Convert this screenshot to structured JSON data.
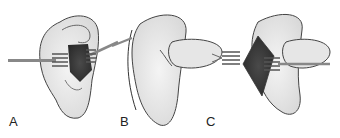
{
  "figure": {
    "panels": [
      {
        "label": "A",
        "description": "Ear with retractors exposing incision in concha"
      },
      {
        "label": "B",
        "description": "Posterior view of auricle with thumb pressing"
      },
      {
        "label": "C",
        "description": "Posterior incision opened with retractors"
      }
    ]
  }
}
